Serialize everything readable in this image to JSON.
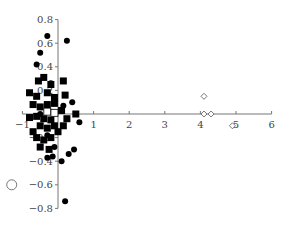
{
  "chart_data": {
    "type": "scatter",
    "title": "",
    "xlabel": "",
    "ylabel": "",
    "xlim": [
      -1,
      6
    ],
    "ylim": [
      -0.8,
      0.8
    ],
    "grid": false,
    "legend": null,
    "x_ticks": [
      "−1",
      "1",
      "2",
      "3",
      "4",
      "5",
      "6"
    ],
    "y_ticks": [
      "0.8",
      "0.6",
      "0.4",
      "0.2",
      "−0.2",
      "−0.4",
      "−0.6",
      "−0.8"
    ],
    "series": [
      {
        "name": "filled-circles",
        "marker": "circle-filled",
        "points": [
          [
            -0.3,
            0.66
          ],
          [
            0.25,
            0.62
          ],
          [
            -0.5,
            0.52
          ],
          [
            -0.6,
            0.42
          ],
          [
            -0.2,
            0.26
          ],
          [
            0.15,
            0.07
          ],
          [
            0.4,
            0.1
          ],
          [
            0.6,
            -0.07
          ],
          [
            0.45,
            -0.3
          ],
          [
            0.3,
            -0.34
          ],
          [
            -0.1,
            -0.28
          ],
          [
            0.1,
            -0.4
          ],
          [
            -0.15,
            -0.36
          ],
          [
            -0.3,
            -0.37
          ],
          [
            0.2,
            -0.74
          ],
          [
            -0.3,
            -0.18
          ],
          [
            -0.5,
            0.0
          ]
        ]
      },
      {
        "name": "filled-squares",
        "marker": "square-filled",
        "points": [
          [
            -0.55,
            0.28
          ],
          [
            -0.4,
            0.31
          ],
          [
            -0.2,
            0.25
          ],
          [
            0.15,
            0.28
          ],
          [
            -0.8,
            0.18
          ],
          [
            -0.6,
            0.15
          ],
          [
            -0.3,
            0.18
          ],
          [
            -0.1,
            0.14
          ],
          [
            0.2,
            0.16
          ],
          [
            -0.7,
            0.08
          ],
          [
            -0.5,
            0.06
          ],
          [
            -0.3,
            0.08
          ],
          [
            -0.1,
            0.09
          ],
          [
            0.1,
            0.03
          ],
          [
            -0.8,
            -0.03
          ],
          [
            -0.6,
            -0.02
          ],
          [
            -0.4,
            -0.04
          ],
          [
            -0.2,
            -0.05
          ],
          [
            0.25,
            -0.04
          ],
          [
            0.5,
            0.0
          ],
          [
            -0.5,
            -0.1
          ],
          [
            -0.3,
            -0.12
          ],
          [
            -0.1,
            -0.1
          ],
          [
            0.15,
            -0.1
          ],
          [
            -0.6,
            -0.2
          ],
          [
            -0.4,
            -0.22
          ],
          [
            -0.2,
            -0.2
          ],
          [
            -0.5,
            -0.28
          ],
          [
            -0.25,
            -0.3
          ],
          [
            -0.7,
            -0.15
          ],
          [
            0.0,
            -0.15
          ]
        ]
      },
      {
        "name": "open-squares",
        "marker": "square-open",
        "points": [
          [
            -0.3,
            0.02
          ],
          [
            -0.1,
            0.01
          ]
        ]
      },
      {
        "name": "open-diamonds",
        "marker": "diamond-open",
        "points": [
          [
            4.1,
            0.15
          ],
          [
            4.1,
            0.0
          ],
          [
            4.3,
            0.0
          ],
          [
            4.9,
            -0.1
          ]
        ]
      },
      {
        "name": "open-circle-large",
        "marker": "circle-open",
        "points": [
          [
            -1.3,
            -0.6
          ]
        ]
      }
    ]
  }
}
